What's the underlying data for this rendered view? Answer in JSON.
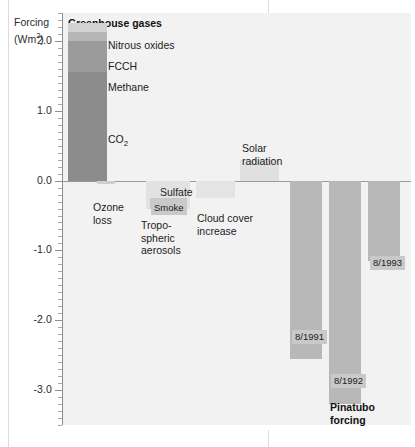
{
  "figure": {
    "axis_title_line1": "Forcing",
    "axis_title_line2": "(Wm",
    "axis_title_sup": "2",
    "axis_title_close": ")",
    "panel_header": "Greenhouse gases"
  },
  "labels": {
    "nitrous_oxides": "Nitrous oxides",
    "fcch": "FCCH",
    "methane": "Methane",
    "co2": "CO",
    "co2_sub": "2",
    "ozone_loss": "Ozone\nloss",
    "sulfate": "Sulfate",
    "smoke": "Smoke",
    "tropospheric_aerosols": "Tropo-\nspheric\naerosols",
    "cloud_cover_increase": "Cloud cover\nincrease",
    "solar_radiation": "Solar\nradiation",
    "pinatubo_1991": "8/1991",
    "pinatubo_1992": "8/1992",
    "pinatubo_1993": "8/1993",
    "pinatubo_forcing": "Pinatubo\nforcing"
  },
  "colors": {
    "panel_background": "#f2f2f2",
    "ghg_co2": "#8c8c8c",
    "ghg_methane": "#9b9b9b",
    "ghg_fcch": "#b6b6b6",
    "ghg_nitrous_oxides": "#d2d2d2",
    "sulfate_bar": "#e2e2e2",
    "smoke_chip": "#c9c9c9",
    "cloud_cover_bar": "#e4e4e4",
    "solar_bar": "#e0e0e0",
    "pinatubo_bar": "#b8b8b8",
    "ozone_bar": "#cfcfcf",
    "axis": "#8d8d8d",
    "text": "#222222"
  },
  "chart_data": {
    "type": "bar",
    "title": "",
    "subtitle": "",
    "xlabel": "",
    "ylabel": "Forcing (Wm2)",
    "ylim": [
      -3.5,
      2.4
    ],
    "yticks": [
      "2.0",
      "1.0",
      "0.0",
      "-1.0",
      "-2.0",
      "-3.0"
    ],
    "ytick_values": [
      2.0,
      1.0,
      0.0,
      -1.0,
      -2.0,
      -3.0
    ],
    "minor_tick_step": 0.1,
    "grid": false,
    "legend": "none",
    "zero_baseline": 0.0,
    "groups": [
      {
        "name": "Greenhouse gases",
        "stacked": true,
        "total": 2.25,
        "segments": [
          {
            "label": "CO2",
            "value": 1.55,
            "from": 0.0,
            "to": 1.55,
            "color": "#8c8c8c"
          },
          {
            "label": "Methane",
            "value": 0.45,
            "from": 1.55,
            "to": 2.0,
            "color": "#9b9b9b"
          },
          {
            "label": "FCCH",
            "value": 0.13,
            "from": 2.0,
            "to": 2.13,
            "color": "#b6b6b6"
          },
          {
            "label": "Nitrous oxides",
            "value": 0.12,
            "from": 2.13,
            "to": 2.25,
            "color": "#d2d2d2"
          }
        ]
      },
      {
        "name": "Ozone loss",
        "stacked": false,
        "segments": [
          {
            "label": "Ozone loss",
            "value": -0.05,
            "from": 0.0,
            "to": -0.05,
            "color": "#cfcfcf"
          }
        ]
      },
      {
        "name": "Tropospheric aerosols",
        "stacked": true,
        "segments": [
          {
            "label": "Sulfate",
            "value": -0.4,
            "from": 0.0,
            "to": -0.4,
            "color": "#e2e2e2"
          },
          {
            "label": "Smoke",
            "value": -0.15,
            "from": -0.25,
            "to": -0.4,
            "color": "#c9c9c9"
          }
        ]
      },
      {
        "name": "Cloud cover increase",
        "stacked": false,
        "segments": [
          {
            "label": "Cloud cover increase",
            "value": -0.25,
            "from": 0.0,
            "to": -0.25,
            "color": "#e4e4e4"
          }
        ]
      },
      {
        "name": "Solar radiation",
        "stacked": false,
        "segments": [
          {
            "label": "Solar radiation",
            "value": 0.3,
            "from": 0.0,
            "to": 0.3,
            "color": "#e0e0e0"
          }
        ]
      },
      {
        "name": "Pinatubo forcing",
        "stacked": false,
        "segments": [
          {
            "label": "8/1991",
            "value": -2.55,
            "from": 0.0,
            "to": -2.55,
            "color": "#b8b8b8"
          },
          {
            "label": "8/1992",
            "value": -3.2,
            "from": 0.0,
            "to": -3.2,
            "color": "#b8b8b8"
          },
          {
            "label": "8/1993",
            "value": -1.15,
            "from": 0.0,
            "to": -1.15,
            "color": "#b8b8b8"
          }
        ]
      }
    ]
  }
}
